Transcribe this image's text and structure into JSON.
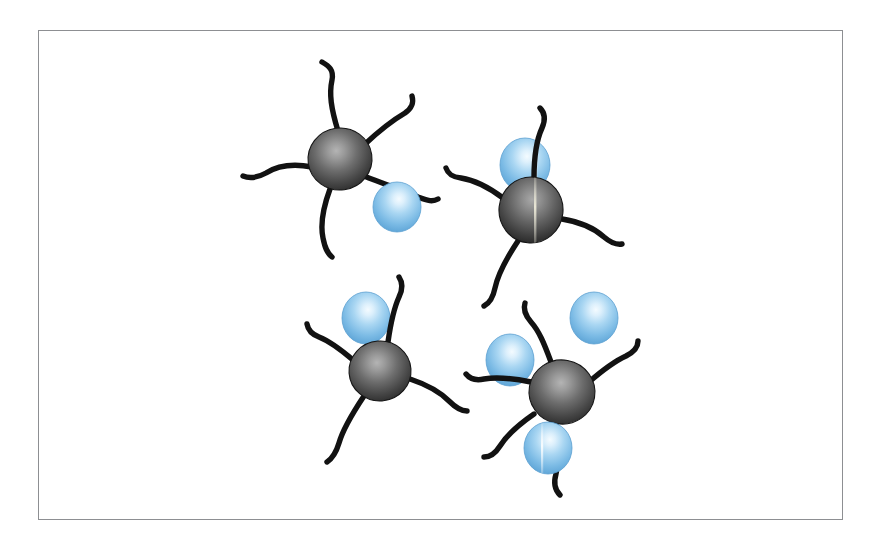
{
  "figure": {
    "domain": "diagram",
    "kind": "schematic-illustration",
    "title": "Tentacled dark particles with attached blue spheres",
    "description": "Four dark grey spherical particles, each bearing several wavy black tentacle-like arms, dispersed on a white field inside a thin rectangular frame. Four light-blue glossy spheres are bound adjacent to particles and one blue sphere floats free.",
    "background_color": "#ffffff",
    "frame": {
      "x": 38,
      "y": 30,
      "width": 805,
      "height": 490,
      "border_color": "#8d8f92",
      "border_width": 1,
      "fill": "#ffffff"
    },
    "canvas": {
      "width": 879,
      "height": 552
    },
    "palette": {
      "particle_core_highlight": "#a8a8a8",
      "particle_core_mid": "#6b6b6b",
      "particle_core_edge": "#2e2e2e",
      "particle_outline": "#141414",
      "arm_color": "#121212",
      "blue_sphere_highlight": "#eaf5fd",
      "blue_sphere_mid": "#9fd0ef",
      "blue_sphere_edge": "#5ba3d6",
      "blue_sphere_rim": "#4a94cb",
      "frame_border": "#8d8f92"
    },
    "counts": {
      "dark_particles": 4,
      "blue_spheres_total": 5,
      "blue_spheres_bound": 4,
      "blue_spheres_free": 1,
      "total_arms": 16
    }
  },
  "legend_text": {
    "dark_particle_name": "dark grey tentacled particle",
    "blue_sphere_name": "blue sphere",
    "arm_name": "tentacle arm"
  },
  "elements": {
    "particles": [
      {
        "id": "particle-1",
        "label": "tentacled particle top-left",
        "cx": 340,
        "cy": 159,
        "rx": 32,
        "ry": 31,
        "rotation": -8,
        "arm_count": 4,
        "arms": [
          "M 338 131 C 331 108 329 94 332 80 C 334 70 329 66 322 62",
          "M 364 145 C 381 129 393 120 405 113 C 412 108 414 103 412 96",
          "M 312 167 C 291 163 277 166 266 173 C 257 178 250 179 243 176",
          "M 330 189 C 323 208 320 224 323 238 C 325 248 327 253 332 257"
        ],
        "bridge_arm": "M 364 176 C 387 185 404 191 418 197 C 428 201 433 202 438 199"
      },
      {
        "id": "particle-2",
        "label": "tentacled particle top-right",
        "cx": 531,
        "cy": 210,
        "rx": 32,
        "ry": 33,
        "rotation": 6,
        "arm_count": 4,
        "seam": true,
        "arms": [
          "M 534 178 C 534 157 536 141 542 128 C 546 119 545 113 540 108",
          "M 503 198 C 487 186 474 180 461 178 C 452 177 448 174 446 168",
          "M 562 219 C 581 222 594 228 604 237 C 611 243 616 245 622 244",
          "M 518 241 C 506 259 498 274 495 288 C 493 298 490 303 484 306"
        ]
      },
      {
        "id": "particle-3",
        "label": "tentacled particle bottom-left",
        "cx": 380,
        "cy": 371,
        "rx": 31,
        "ry": 30,
        "rotation": -4,
        "arm_count": 4,
        "arms": [
          "M 388 342 C 391 321 394 308 399 297 C 403 289 403 283 399 277",
          "M 353 360 C 339 348 329 341 319 337 C 311 334 308 330 307 324",
          "M 410 379 C 428 385 440 392 449 401 C 456 408 461 411 467 411",
          "M 364 396 C 352 414 343 429 339 443 C 336 453 333 458 327 462"
        ]
      },
      {
        "id": "particle-4",
        "label": "tentacled particle bottom-right",
        "cx": 562,
        "cy": 392,
        "rx": 33,
        "ry": 32,
        "rotation": 10,
        "arm_count": 4,
        "arms": [
          "M 551 362 C 544 343 539 331 531 322 C 525 315 523 309 525 303",
          "M 531 382 C 511 378 496 377 484 379 C 475 381 470 379 466 374",
          "M 589 382 C 604 369 615 361 626 356 C 634 352 638 347 638 341",
          "M 556 424 C 558 446 559 461 556 474 C 553 484 555 490 560 495"
        ]
      }
    ],
    "blue_spheres": [
      {
        "id": "blue-1",
        "label": "blue sphere bound to top-left particle",
        "cx": 397,
        "cy": 207,
        "rx": 24,
        "ry": 25,
        "bound_to": "particle-1",
        "seam": false
      },
      {
        "id": "blue-2",
        "label": "blue sphere bound to top-right particle",
        "cx": 525,
        "cy": 165,
        "rx": 25,
        "ry": 27,
        "bound_to": "particle-2",
        "seam": true
      },
      {
        "id": "blue-3",
        "label": "blue sphere bound to bottom-left particle",
        "cx": 366,
        "cy": 318,
        "rx": 24,
        "ry": 26,
        "bound_to": "particle-3",
        "seam": false
      },
      {
        "id": "blue-4",
        "label": "blue sphere bound above bottom-right particle",
        "cx": 510,
        "cy": 360,
        "rx": 24,
        "ry": 26,
        "bound_to": "particle-4",
        "seam": false
      },
      {
        "id": "blue-5",
        "label": "blue sphere bound below bottom-right particle",
        "cx": 548,
        "cy": 448,
        "rx": 24,
        "ry": 26,
        "bound_to": "particle-4",
        "seam": true
      },
      {
        "id": "blue-free",
        "label": "free unbound blue sphere",
        "cx": 594,
        "cy": 318,
        "rx": 24,
        "ry": 26,
        "bound_to": null,
        "seam": false
      }
    ]
  }
}
